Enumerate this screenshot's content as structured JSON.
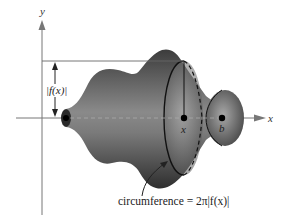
{
  "figure": {
    "type": "solid-of-revolution",
    "axes": {
      "x_label": "x",
      "y_label": "y"
    },
    "points": {
      "x_point_label": "x",
      "b_point_label": "b"
    },
    "radius_label": "|f(x)|",
    "caption": "circumference = 2π|f(x)|",
    "colors": {
      "solid_dark": "#3a3a3a",
      "solid_light": "#a0a0a0",
      "axis": "#777777",
      "outline": "#111111"
    }
  }
}
